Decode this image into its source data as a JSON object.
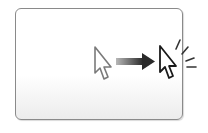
{
  "illustration": {
    "description": "cursor moves to target and clicks",
    "icons": [
      "cursor-start-icon",
      "right-arrow-icon",
      "cursor-end-icon",
      "click-burst-icon"
    ],
    "colors": {
      "frame_border": "#8a8a8a",
      "cursor_start_stroke": "#7a7a7a",
      "cursor_end_stroke": "#1a1a1a",
      "arrow_dark": "#2e2e2e",
      "arrow_light": "#b0b0b0",
      "burst": "#333333"
    }
  }
}
